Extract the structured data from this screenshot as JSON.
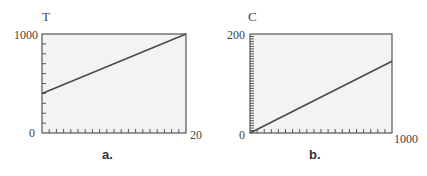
{
  "chart_data": [
    {
      "type": "line",
      "caption": "a.",
      "ylabel": "T",
      "xlabel": "",
      "xlim": [
        0,
        20
      ],
      "ylim": [
        0,
        1000
      ],
      "x_tick_labels": [
        "0",
        "20"
      ],
      "y_tick_labels": [
        "0",
        "1000"
      ],
      "x_minor_ticks": 20,
      "y_minor_ticks": 10,
      "grid": false,
      "series": [
        {
          "name": "T",
          "x": [
            0,
            20
          ],
          "values": [
            400,
            1000
          ]
        }
      ]
    },
    {
      "type": "line",
      "caption": "b.",
      "ylabel": "C",
      "xlabel": "",
      "xlim": [
        0,
        1000
      ],
      "ylim": [
        0,
        200
      ],
      "x_tick_labels": [
        "0",
        "1000"
      ],
      "y_tick_labels": [
        "0",
        "200"
      ],
      "x_minor_ticks": 20,
      "y_minor_ticks": 40,
      "grid": false,
      "series": [
        {
          "name": "C",
          "x": [
            0,
            1000
          ],
          "values": [
            0,
            145
          ]
        }
      ]
    }
  ],
  "colors": {
    "plot_bg": "#f3f3f3",
    "frame": "#555555",
    "line": "#4a4a4a"
  }
}
